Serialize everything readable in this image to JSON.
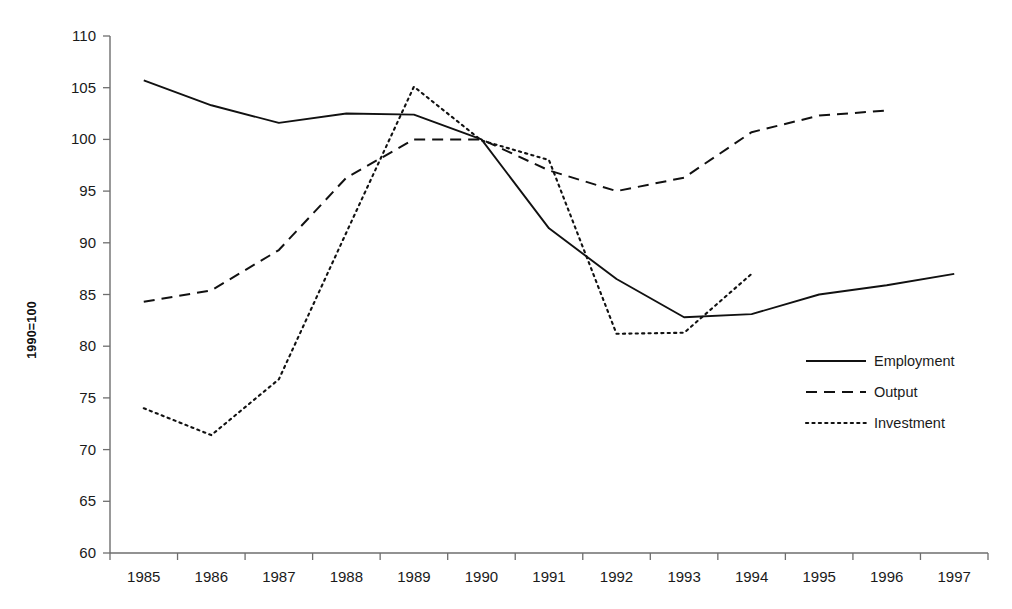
{
  "chart_data": {
    "type": "line",
    "title": "",
    "subtitle": "",
    "xlabel": "",
    "ylabel": "1990=100",
    "categories": [
      "1985",
      "1986",
      "1987",
      "1988",
      "1989",
      "1990",
      "1991",
      "1992",
      "1993",
      "1994",
      "1995",
      "1996",
      "1997"
    ],
    "x_tick_labels": [
      "1985",
      "1986",
      "1987",
      "1988",
      "1989",
      "1990",
      "1991",
      "1992",
      "1993",
      "1994",
      "1995",
      "1996",
      "1997"
    ],
    "y_tick_labels": [
      "110",
      "105",
      "100",
      "95",
      "90",
      "85",
      "80",
      "75",
      "70",
      "65",
      "60"
    ],
    "ylim": [
      60,
      110
    ],
    "y_tick_step": 5,
    "grid": false,
    "legend_position": "right-middle",
    "series": [
      {
        "name": "Employment",
        "style": "solid",
        "color": "#111111",
        "x": [
          "1985",
          "1986",
          "1987",
          "1988",
          "1989",
          "1990",
          "1991",
          "1992",
          "1993",
          "1994",
          "1995",
          "1996",
          "1997"
        ],
        "values": [
          105.7,
          103.3,
          101.6,
          102.5,
          102.4,
          100.0,
          91.4,
          86.5,
          82.8,
          83.1,
          85.0,
          85.9,
          87.0
        ]
      },
      {
        "name": "Output",
        "style": "dashed",
        "color": "#111111",
        "x": [
          "1985",
          "1986",
          "1987",
          "1988",
          "1989",
          "1990",
          "1991",
          "1992",
          "1993",
          "1994",
          "1995",
          "1996"
        ],
        "values": [
          84.3,
          85.4,
          89.3,
          96.3,
          100.0,
          100.0,
          97.0,
          95.0,
          96.3,
          100.7,
          102.3,
          102.8
        ]
      },
      {
        "name": "Investment",
        "style": "dotted",
        "color": "#111111",
        "x": [
          "1985",
          "1986",
          "1987",
          "1988",
          "1989",
          "1990",
          "1991",
          "1992",
          "1993",
          "1994"
        ],
        "values": [
          74.0,
          71.4,
          76.8,
          91.0,
          105.1,
          99.9,
          98.0,
          81.2,
          81.3,
          87.0
        ]
      }
    ]
  },
  "legend": {
    "items": [
      {
        "label": "Employment",
        "style": "solid"
      },
      {
        "label": "Output",
        "style": "dashed"
      },
      {
        "label": "Investment",
        "style": "dotted"
      }
    ]
  },
  "axes": {
    "y_axis_title": "1990=100"
  }
}
